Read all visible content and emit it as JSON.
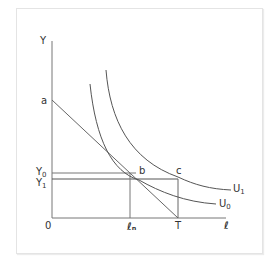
{
  "diagram": {
    "type": "indifference-curve budget diagram",
    "axes": {
      "y_label": "Y",
      "x_label": "ℓ",
      "origin_label": "0"
    },
    "points": {
      "a": "a",
      "b": "b",
      "c": "c"
    },
    "y_levels": [
      {
        "base": "Y",
        "sub": "0"
      },
      {
        "base": "Y",
        "sub": "1"
      }
    ],
    "x_ticks": {
      "ln": "ℓₙ",
      "T": "T"
    },
    "curves": [
      {
        "base": "U",
        "sub": "1"
      },
      {
        "base": "U",
        "sub": "0"
      }
    ],
    "colors": {
      "lines": "#555555",
      "text": "#333333",
      "frame": "#e4e4e4"
    }
  }
}
